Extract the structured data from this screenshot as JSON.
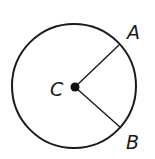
{
  "diagram": {
    "type": "circle-with-radii",
    "colors": {
      "stroke": "#1a1a1a",
      "background": "#ffffff"
    },
    "circle": {
      "center_label": "C",
      "center": [
        74,
        86
      ],
      "radius": 62
    },
    "points": [
      {
        "label": "A",
        "position": [
          119,
          45
        ],
        "label_position": [
          127,
          39
        ]
      },
      {
        "label": "B",
        "position": [
          121,
          128
        ],
        "label_position": [
          126,
          149
        ]
      }
    ],
    "center_label_position": [
      50,
      96
    ],
    "segments": [
      {
        "from": "C",
        "to": "A"
      },
      {
        "from": "C",
        "to": "B"
      }
    ]
  }
}
